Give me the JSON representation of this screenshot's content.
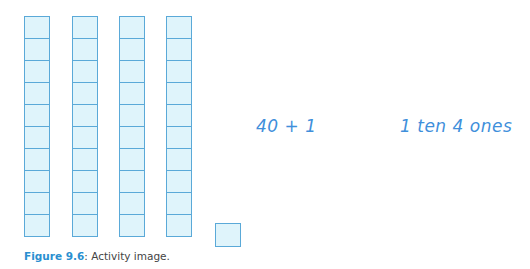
{
  "figure": {
    "rods": [
      {
        "left": 24,
        "cubes": 10
      },
      {
        "left": 72,
        "cubes": 10
      },
      {
        "left": 119,
        "cubes": 10
      },
      {
        "left": 166,
        "cubes": 10
      }
    ],
    "single_cubes": 1,
    "expression_1": "40 + 1",
    "expression_2": "1 ten 4 ones",
    "caption_label": "Figure 9.6",
    "caption_text": ": Activity image.",
    "colors": {
      "cube_fill": "#dff4fb",
      "cube_border": "#5aa9d8",
      "handwriting": "#3f8fdb",
      "caption_label": "#2a8fd0"
    }
  }
}
